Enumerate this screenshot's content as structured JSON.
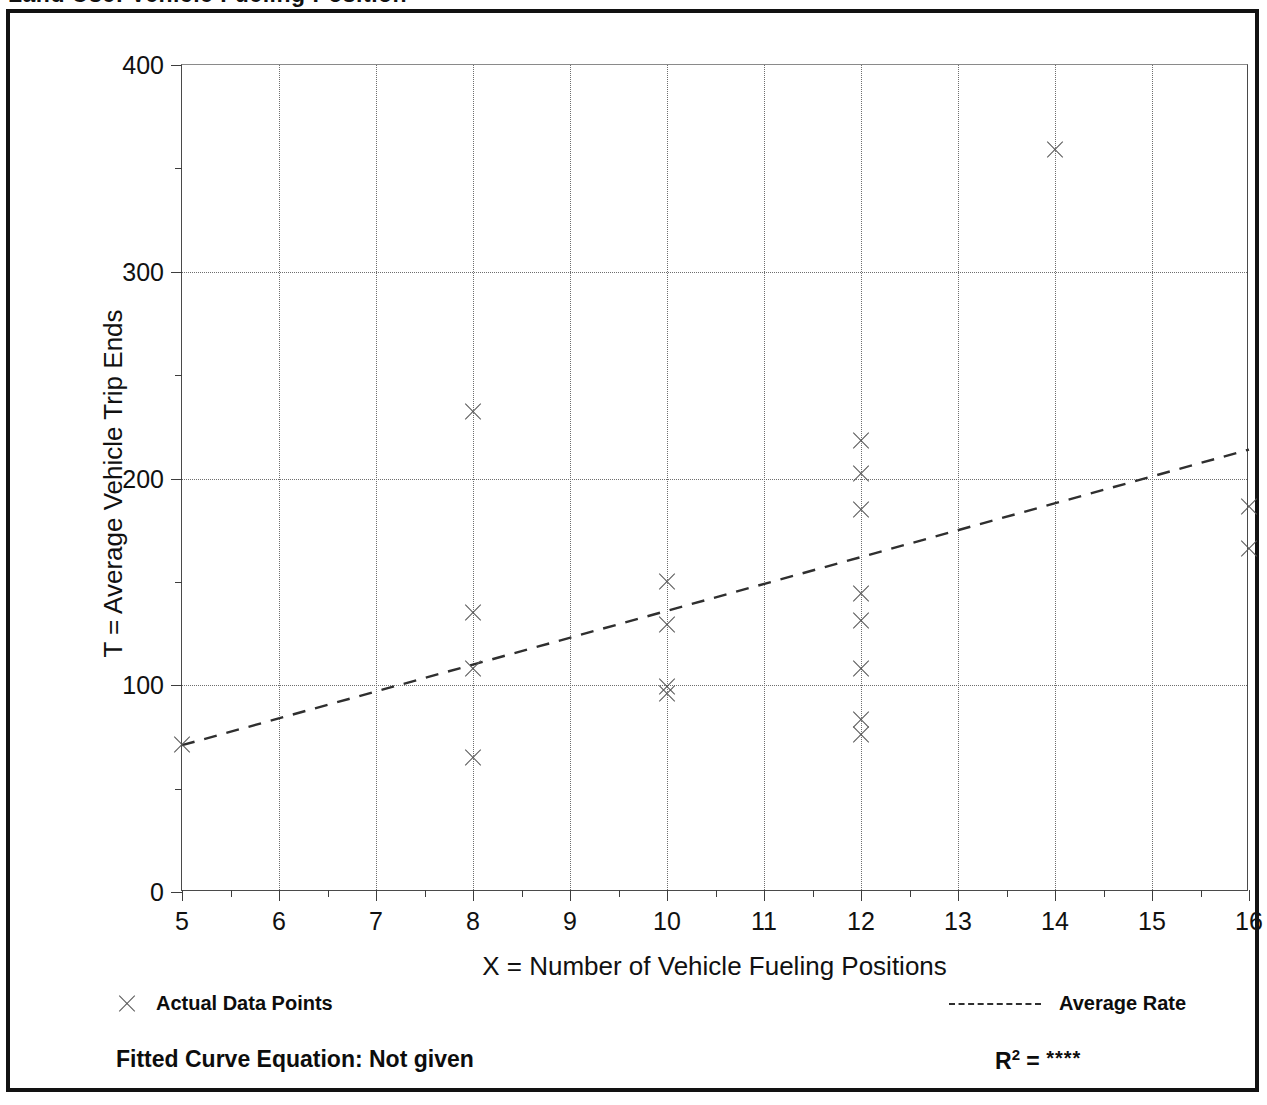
{
  "figure": {
    "cut_off_title": "Land Use:  Vehicle Fueling Position",
    "background_color": "#ffffff",
    "frame_color": "#121212"
  },
  "chart_data": {
    "type": "scatter",
    "title": "",
    "xlabel": "X = Number of Vehicle Fueling Positions",
    "ylabel": "T = Average Vehicle Trip Ends",
    "xlim": [
      5,
      16
    ],
    "ylim": [
      0,
      400
    ],
    "grid": true,
    "x_major_ticks": [
      5,
      6,
      7,
      8,
      9,
      10,
      11,
      12,
      13,
      14,
      15,
      16
    ],
    "x_tick_labels": [
      "5",
      "6",
      "7",
      "8",
      "9",
      "10",
      "11",
      "12",
      "13",
      "14",
      "15",
      "16"
    ],
    "x_minor_ticks": [
      5.5,
      6.5,
      7.5,
      8.5,
      9.5,
      10.5,
      11.5,
      12.5,
      13.5,
      14.5,
      15.5
    ],
    "y_major_ticks": [
      0,
      100,
      200,
      300,
      400
    ],
    "y_tick_labels": [
      "0",
      "100",
      "200",
      "300",
      "400"
    ],
    "y_minor_ticks": [
      50,
      150,
      250,
      350
    ],
    "marker": "x",
    "marker_color": "#555555",
    "series": [
      {
        "name": "Actual Data Points",
        "points": [
          [
            5,
            71
          ],
          [
            8,
            232
          ],
          [
            8,
            135
          ],
          [
            8,
            108
          ],
          [
            8,
            65
          ],
          [
            10,
            150
          ],
          [
            10,
            129
          ],
          [
            10,
            99
          ],
          [
            10,
            96
          ],
          [
            12,
            218
          ],
          [
            12,
            202
          ],
          [
            12,
            185
          ],
          [
            12,
            144
          ],
          [
            12,
            131
          ],
          [
            12,
            108
          ],
          [
            12,
            83
          ],
          [
            12,
            76
          ],
          [
            14,
            359
          ],
          [
            16,
            186
          ],
          [
            16,
            166
          ]
        ]
      }
    ],
    "trendline": {
      "name": "Average Rate",
      "style": "dashed",
      "color": "#2f2f2f",
      "x_start": 5,
      "y_start": 71,
      "x_end": 16,
      "y_end": 214
    }
  },
  "legend": {
    "position": "below-axes",
    "entries": [
      {
        "marker": "x-marker",
        "label": "Actual Data Points"
      },
      {
        "marker": "dashed-line",
        "label": "Average Rate"
      }
    ]
  },
  "footer": {
    "fitted_equation_label": "Fitted Curve Equation:",
    "fitted_equation_value": "Not given",
    "fitted_equation_full": "Fitted Curve Equation:  Not given",
    "r_squared_symbol": "R",
    "r_squared_exponent": "2",
    "r_squared_equals": " = ",
    "r_squared_value": "****"
  }
}
